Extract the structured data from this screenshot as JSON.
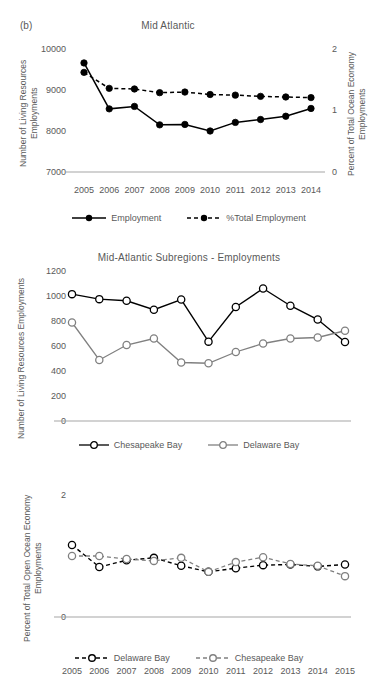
{
  "figure": {
    "panel_label": "(b)"
  },
  "chart_data": [
    {
      "type": "line",
      "title": "Mid Atlantic",
      "xlabel": "",
      "ylabel": "Number of Living Resources Employments",
      "y2label": "Percent of Total Ocean Economy Employments",
      "categories": [
        "2005",
        "2006",
        "2007",
        "2008",
        "2009",
        "2010",
        "2011",
        "2012",
        "2013",
        "2014"
      ],
      "ylim": [
        7000,
        10000
      ],
      "yticks": [
        "7000",
        "8000",
        "9000",
        "10000"
      ],
      "y2lim": [
        0,
        2
      ],
      "y2ticks": [
        "0",
        "1",
        "2"
      ],
      "grid": false,
      "legend_position": "bottom",
      "series": [
        {
          "name": "Employment",
          "axis": "left",
          "style": "solid",
          "color": "#000000",
          "values": [
            9660,
            8540,
            8600,
            8150,
            8160,
            8000,
            8210,
            8280,
            8360,
            8550
          ]
        },
        {
          "name": "%Total Employment",
          "axis": "right",
          "style": "dashed",
          "color": "#000000",
          "values": [
            1.62,
            1.36,
            1.35,
            1.29,
            1.3,
            1.26,
            1.25,
            1.23,
            1.22,
            1.21
          ]
        }
      ]
    },
    {
      "type": "line",
      "title": "Mid-Atlantic Subregions - Employments",
      "xlabel": "",
      "ylabel": "Number of Living Resources Employments",
      "categories": [
        "2005",
        "2006",
        "2007",
        "2008",
        "2009",
        "2010",
        "2011",
        "2012",
        "2013",
        "2014",
        "2015"
      ],
      "ylim": [
        0,
        1200
      ],
      "yticks": [
        "0",
        "200",
        "400",
        "600",
        "800",
        "1000",
        "1200"
      ],
      "grid": false,
      "legend_position": "bottom",
      "series": [
        {
          "name": "Chesapeake Bay",
          "style": "solid",
          "color": "#000000",
          "values": [
            1015,
            975,
            962,
            890,
            972,
            635,
            912,
            1060,
            922,
            812,
            632
          ]
        },
        {
          "name": "Delaware Bay",
          "style": "solid",
          "color": "#808080",
          "values": [
            788,
            488,
            608,
            660,
            468,
            462,
            552,
            620,
            660,
            668,
            722
          ]
        }
      ]
    },
    {
      "type": "line",
      "title": "",
      "xlabel": "",
      "ylabel": "Percent of Total Open Ocean Economy Employments",
      "categories": [
        "2005",
        "2006",
        "2007",
        "2008",
        "2009",
        "2010",
        "2011",
        "2012",
        "2013",
        "2014",
        "2015"
      ],
      "ylim": [
        0,
        2
      ],
      "yticks": [
        "0",
        "2"
      ],
      "grid": false,
      "legend_position": "bottom",
      "series": [
        {
          "name": "Delaware Bay",
          "style": "dashed",
          "color": "#000000",
          "values": [
            1.18,
            0.82,
            0.93,
            0.97,
            0.84,
            0.74,
            0.8,
            0.85,
            0.86,
            0.83,
            0.86
          ]
        },
        {
          "name": "Chesapeake Bay",
          "style": "dashed",
          "color": "#808080",
          "values": [
            1.0,
            1.0,
            0.95,
            0.92,
            0.97,
            0.74,
            0.9,
            0.98,
            0.87,
            0.84,
            0.67
          ]
        }
      ]
    }
  ]
}
